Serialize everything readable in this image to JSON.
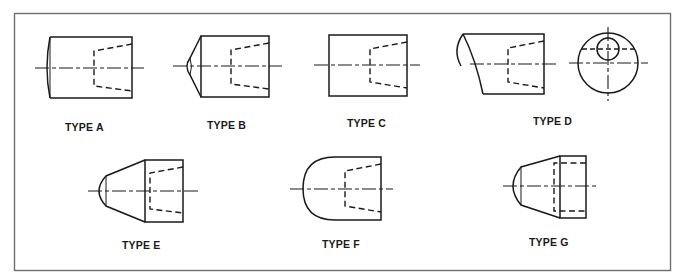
{
  "figure": {
    "colors": {
      "line": "#1a1a1a",
      "frame": "#6f6f6f",
      "background": "#ffffff"
    },
    "types": [
      {
        "id": "a",
        "label": "TYPE A",
        "description": "cylinder with slightly convex end, tapered hidden bore"
      },
      {
        "id": "b",
        "label": "TYPE B",
        "description": "cylinder with chamfered conical end and small dome tip, tapered hidden bore"
      },
      {
        "id": "c",
        "label": "TYPE C",
        "description": "plain flat-ended cylinder, tapered hidden bore"
      },
      {
        "id": "d",
        "label": "TYPE D",
        "description": "cylinder with angled elliptical end, side and end views with offset hole"
      },
      {
        "id": "e",
        "label": "TYPE E",
        "description": "cylinder with conical taper and dome tip, tapered hidden bore"
      },
      {
        "id": "f",
        "label": "TYPE F",
        "description": "cylinder with full hemispherical end, tapered hidden bore"
      },
      {
        "id": "g",
        "label": "TYPE G",
        "description": "cylinder with conical taper and dome tip, straight hidden counterbore"
      }
    ]
  }
}
